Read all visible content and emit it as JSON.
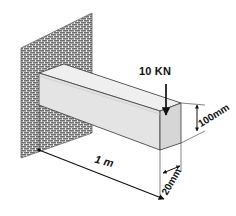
{
  "figure": {
    "background_color": "#ffffff"
  },
  "wall": {
    "name": "hatched-support-wall",
    "hatch_style": "brick",
    "fill_color": "#e9e9e9",
    "stroke_color": "#5a5a5a"
  },
  "beam": {
    "name": "cantilever-beam",
    "top_face_color": "#efefef",
    "front_face_color": "#e2e2e2",
    "end_face_color": "#d6d6d6",
    "stroke_color": "#4a4a4a"
  },
  "load": {
    "label": "10 KN",
    "direction": "down",
    "arrow_color": "#111111"
  },
  "dimensions": [
    {
      "id": "length",
      "label": "1 m",
      "orientation": "diagonal",
      "style": "italic-bold"
    },
    {
      "id": "height",
      "label": "100mm",
      "orientation": "rotated",
      "style": "bold"
    },
    {
      "id": "thickness",
      "label": "20mm",
      "orientation": "rotated",
      "style": "bold"
    }
  ],
  "colors": {
    "line": "#111111",
    "hatch": "#6b6b6b",
    "dimension_line": "#222222"
  }
}
